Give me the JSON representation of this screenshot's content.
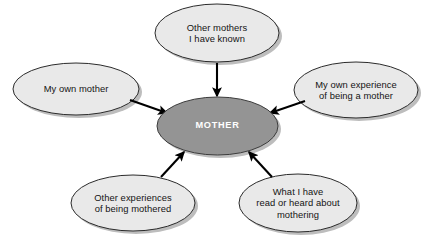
{
  "diagram": {
    "type": "hub-and-spoke concept map",
    "background_color": "#ffffff",
    "center": {
      "id": "center-mother",
      "label": "MOTHER",
      "fill": "#949494",
      "stroke": "#3c3c3c",
      "text_color": "#ffffff",
      "cx": 217.5,
      "cy": 126,
      "rx": 60.5,
      "ry": 29
    },
    "satellite_style": {
      "fill": "#e9e9e9",
      "stroke": "#2b2b2b",
      "text_color": "#141414",
      "shadow": "#b8b8b8"
    },
    "nodes": [
      {
        "id": "node-other-mothers-known",
        "label": "Other mothers\nI have known",
        "cx": 217,
        "cy": 33,
        "rx": 62,
        "ry": 29
      },
      {
        "id": "node-my-own-mother",
        "label": "My own mother",
        "cx": 76,
        "cy": 89,
        "rx": 63,
        "ry": 26
      },
      {
        "id": "node-my-own-experience",
        "label": "My own experience\nof being a mother",
        "cx": 356,
        "cy": 90,
        "rx": 62,
        "ry": 28
      },
      {
        "id": "node-other-experiences",
        "label": "Other experiences\nof being mothered",
        "cx": 133,
        "cy": 203,
        "rx": 62,
        "ry": 28
      },
      {
        "id": "node-read-or-heard",
        "label": "What I have\nread or heard about\nmothering",
        "cx": 298,
        "cy": 203,
        "rx": 59,
        "ry": 29
      }
    ],
    "arrows": [
      {
        "id": "arrow-other-mothers-known-to-center",
        "from": "node-other-mothers-known",
        "to": "center-mother",
        "x1": 217,
        "y1": 63,
        "x2": 217,
        "y2": 96
      },
      {
        "id": "arrow-my-own-mother-to-center",
        "from": "node-my-own-mother",
        "to": "center-mother",
        "x1": 130,
        "y1": 100,
        "x2": 167,
        "y2": 113
      },
      {
        "id": "arrow-my-own-experience-to-center",
        "from": "node-my-own-experience",
        "to": "center-mother",
        "x1": 305,
        "y1": 101,
        "x2": 270,
        "y2": 113
      },
      {
        "id": "arrow-other-experiences-to-center",
        "from": "node-other-experiences",
        "to": "center-mother",
        "x1": 161,
        "y1": 177,
        "x2": 184,
        "y2": 152
      },
      {
        "id": "arrow-read-or-heard-to-center",
        "from": "node-read-or-heard",
        "to": "center-mother",
        "x1": 272,
        "y1": 177,
        "x2": 249,
        "y2": 152
      }
    ]
  }
}
